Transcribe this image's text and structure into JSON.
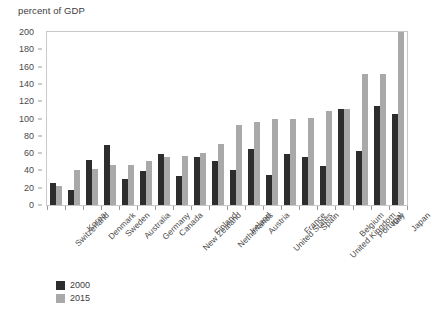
{
  "chart_data": {
    "type": "bar",
    "title": "percent of GDP",
    "xlabel": "",
    "ylabel": "percent of GDP",
    "ylim": [
      0,
      200
    ],
    "ytick_step": 20,
    "yticks": [
      0,
      20,
      40,
      60,
      80,
      100,
      120,
      140,
      160,
      180,
      200
    ],
    "grid": false,
    "legend_position": "bottom-left",
    "categories": [
      "Switzerland",
      "Korea",
      "Denmark",
      "Sweden",
      "Australia",
      "Germany",
      "Canada",
      "New Zealand",
      "Finland",
      "Netherlands",
      "Ireland",
      "Austria",
      "United States",
      "France",
      "Spain",
      "United Kingdom",
      "Belgium",
      "Portugal",
      "Italy",
      "Japan"
    ],
    "series": [
      {
        "name": "2000",
        "color": "#2d2d2d",
        "values": [
          26,
          17,
          52,
          69,
          30,
          39,
          59,
          33,
          55,
          51,
          40,
          65,
          35,
          59,
          55,
          45,
          111,
          62,
          115,
          105
        ]
      },
      {
        "name": "2015",
        "color": "#a9a9a9",
        "values": [
          22,
          40,
          42,
          46,
          46,
          51,
          55,
          57,
          60,
          71,
          93,
          96,
          100,
          100,
          101,
          109,
          111,
          152,
          152,
          200
        ]
      }
    ]
  },
  "legend": {
    "items": [
      {
        "label": "2000",
        "color": "#2d2d2d"
      },
      {
        "label": "2015",
        "color": "#a9a9a9"
      }
    ]
  },
  "colors": {
    "series_2000": "#2d2d2d",
    "series_2015": "#a9a9a9",
    "axis": "#9a9a9a",
    "frame": "#c9c9c9",
    "text": "#3c3c3c",
    "background": "#ffffff"
  }
}
